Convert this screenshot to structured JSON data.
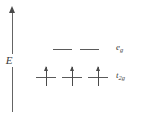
{
  "diagram": {
    "type": "crystal-field-splitting-diagram",
    "title": "",
    "axis": {
      "label": "E",
      "name": "energy-axis",
      "direction": "up",
      "arrowhead": true,
      "x_px": 12,
      "top_px": 6,
      "bottom_px": 112
    },
    "colors": {
      "line": "#5a5a5a",
      "arrow": "#4a4a4a",
      "text": "#3a3a3a",
      "background": "#ffffff"
    },
    "levels": [
      {
        "id": "eg",
        "label": "e",
        "subscript": "g",
        "label_plain": "eg",
        "energy_rank": 2,
        "orbital_count": 2,
        "electrons_per_orbital": [
          0,
          0
        ],
        "total_electrons": 0,
        "y_px": 49,
        "orbitals": [
          {
            "x_px": 53,
            "width_px": 19,
            "electrons": 0
          },
          {
            "x_px": 80,
            "width_px": 19,
            "electrons": 0
          }
        ]
      },
      {
        "id": "t2g",
        "label": "t",
        "subscript": "2g",
        "label_plain": "t2g",
        "energy_rank": 1,
        "orbital_count": 3,
        "electrons_per_orbital": [
          1,
          1,
          1
        ],
        "total_electrons": 3,
        "spin": "up",
        "y_px": 77,
        "orbitals": [
          {
            "x_px": 36,
            "width_px": 20,
            "electrons": 1
          },
          {
            "x_px": 62,
            "width_px": 20,
            "electrons": 1
          },
          {
            "x_px": 88,
            "width_px": 20,
            "electrons": 1
          }
        ]
      }
    ]
  }
}
